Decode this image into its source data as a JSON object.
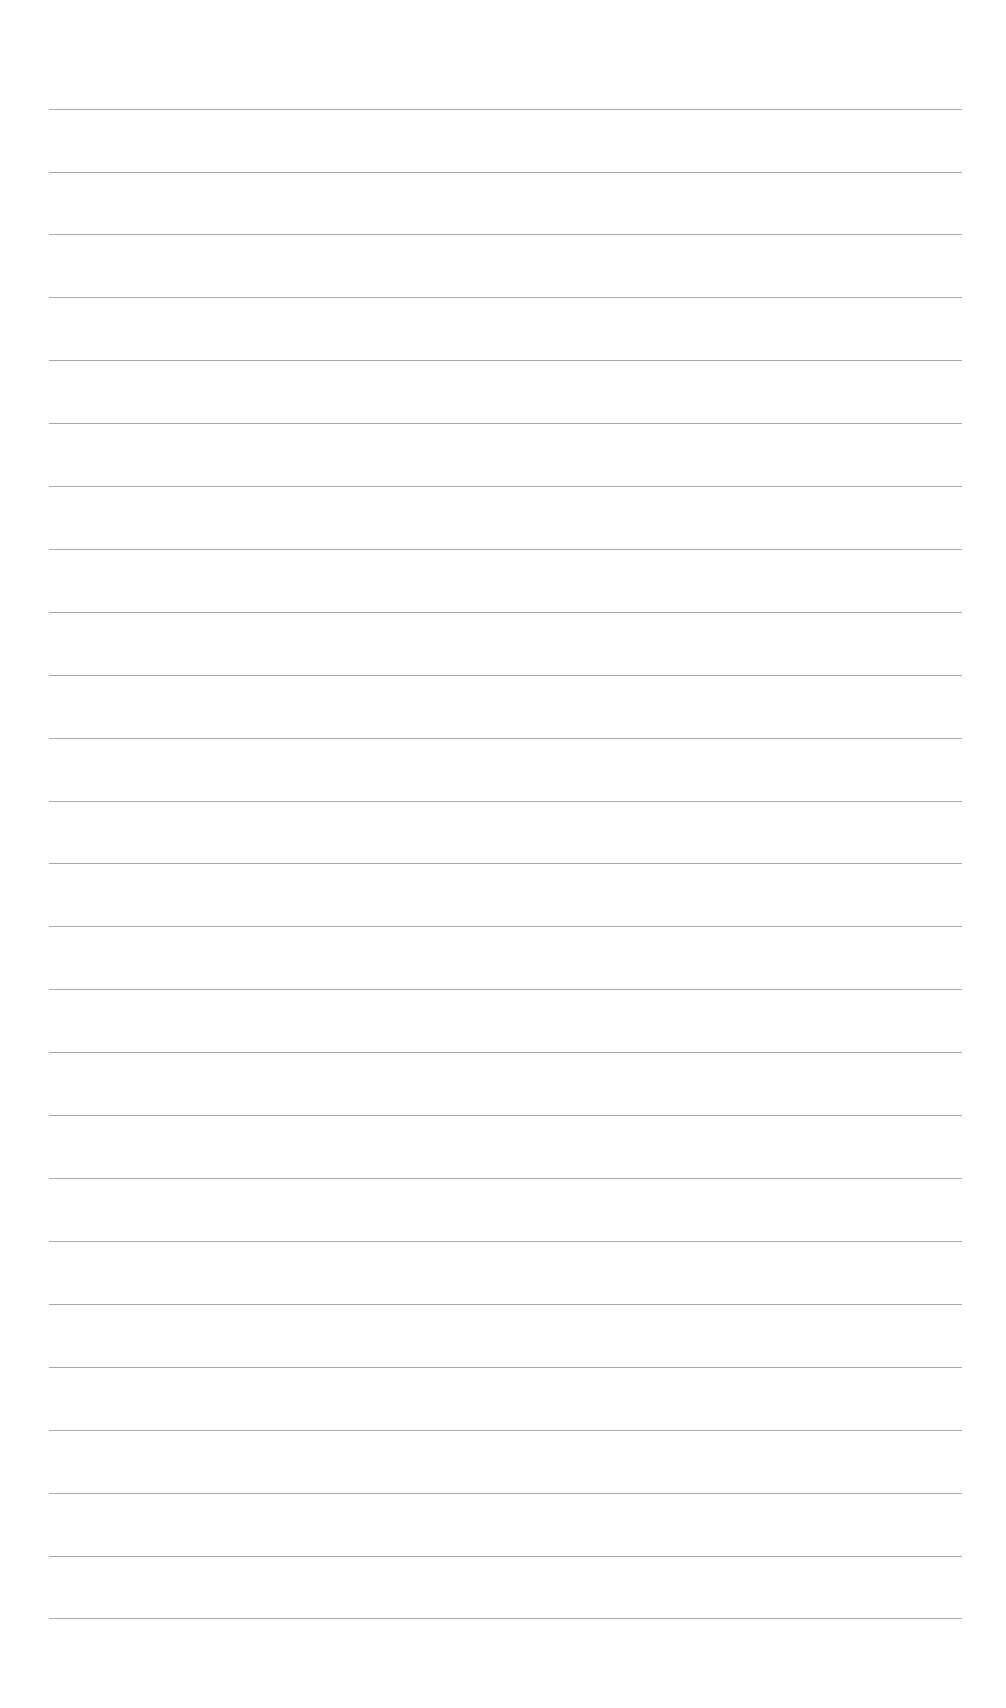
{
  "page": {
    "type": "lined-paper",
    "background_color": "#ffffff",
    "line_color": "#9a9a9a",
    "line_count": 25,
    "line_left_px": 49,
    "line_right_px": 962,
    "first_line_y_px": 109,
    "line_spacing_px": 62.9,
    "lines": [
      {
        "y": 109
      },
      {
        "y": 172
      },
      {
        "y": 234
      },
      {
        "y": 297
      },
      {
        "y": 360
      },
      {
        "y": 423
      },
      {
        "y": 486
      },
      {
        "y": 549
      },
      {
        "y": 612
      },
      {
        "y": 675
      },
      {
        "y": 738
      },
      {
        "y": 801
      },
      {
        "y": 863
      },
      {
        "y": 926
      },
      {
        "y": 989
      },
      {
        "y": 1052
      },
      {
        "y": 1115
      },
      {
        "y": 1178
      },
      {
        "y": 1241
      },
      {
        "y": 1304
      },
      {
        "y": 1367
      },
      {
        "y": 1430
      },
      {
        "y": 1493
      },
      {
        "y": 1556
      },
      {
        "y": 1618
      }
    ]
  }
}
